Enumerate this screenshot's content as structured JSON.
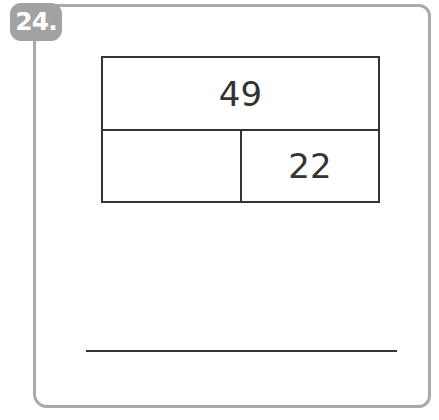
{
  "problem": {
    "number": "24.",
    "bar_model": {
      "total": "49",
      "part_left": "",
      "part_right": "22"
    },
    "answer": ""
  },
  "colors": {
    "badge": "#a2a2a2",
    "frame": "#a9a9a9",
    "lines": "#333333"
  }
}
